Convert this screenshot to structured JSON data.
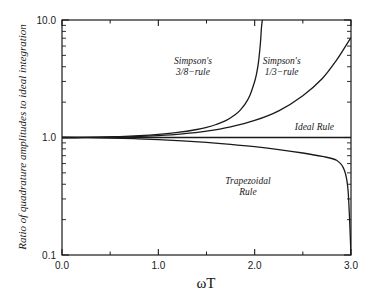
{
  "chart_data": {
    "type": "line",
    "title": "",
    "xlabel": "ωT",
    "ylabel": "Ratio of quadrature amplitudes to ideal integration",
    "xlim": [
      0.0,
      3.0
    ],
    "ylim": [
      0.1,
      10.0
    ],
    "yscale": "log",
    "xscale": "linear",
    "grid": false,
    "legend_position": "inline-annotations",
    "xticks": [
      "0.0",
      "1.0",
      "2.0",
      "3.0"
    ],
    "xtick_values": [
      0.0,
      1.0,
      2.0,
      3.0
    ],
    "yticks": [
      "0.1",
      "1.0",
      "10.0"
    ],
    "ytick_values": [
      0.1,
      1.0,
      10.0
    ],
    "series": [
      {
        "name": "Simpson's 3/8-rule",
        "label_lines": [
          "Simpson's",
          "3/8−rule"
        ],
        "x": [
          0.0,
          0.2,
          0.4,
          0.6,
          0.8,
          1.0,
          1.2,
          1.4,
          1.5,
          1.6,
          1.7,
          1.8,
          1.85,
          1.9,
          1.95,
          2.0,
          2.02,
          2.04,
          2.06,
          2.07,
          2.08
        ],
        "values": [
          1.0,
          1.001,
          1.007,
          1.018,
          1.036,
          1.063,
          1.104,
          1.17,
          1.22,
          1.29,
          1.39,
          1.57,
          1.71,
          1.92,
          2.28,
          3.0,
          3.5,
          4.4,
          6.4,
          8.5,
          10.0
        ]
      },
      {
        "name": "Simpson's 1/3-rule",
        "label_lines": [
          "Simpson's",
          "1/3−rule"
        ],
        "x": [
          0.0,
          0.25,
          0.5,
          0.75,
          1.0,
          1.25,
          1.5,
          1.75,
          2.0,
          2.25,
          2.5,
          2.7,
          2.85,
          2.95,
          3.0
        ],
        "values": [
          1.0,
          1.001,
          1.005,
          1.016,
          1.038,
          1.075,
          1.135,
          1.233,
          1.396,
          1.686,
          2.27,
          3.16,
          4.55,
          6.1,
          7.1
        ]
      },
      {
        "name": "Trapezoidal Rule",
        "label_lines": [
          "Trapezoidal",
          "Rule"
        ],
        "x": [
          0.0,
          0.25,
          0.5,
          0.75,
          1.0,
          1.25,
          1.5,
          1.75,
          2.0,
          2.25,
          2.5,
          2.7,
          2.85,
          2.93,
          2.97,
          3.0
        ],
        "values": [
          1.0,
          0.997,
          0.99,
          0.977,
          0.959,
          0.936,
          0.908,
          0.874,
          0.835,
          0.79,
          0.738,
          0.69,
          0.64,
          0.53,
          0.35,
          0.1
        ]
      },
      {
        "name": "Ideal Rule",
        "label_lines": [
          "Ideal Rule"
        ],
        "x": [
          0.0,
          3.0
        ],
        "values": [
          1.0,
          1.0
        ]
      }
    ],
    "annotations": [
      {
        "text_lines": [
          "Simpson's",
          "3/8−rule"
        ],
        "x": 1.36,
        "y": 4.2
      },
      {
        "text_lines": [
          "Simpson's",
          "1/3−rule"
        ],
        "x": 2.28,
        "y": 4.2
      },
      {
        "text_lines": [
          "Ideal Rule"
        ],
        "x": 2.62,
        "y": 1.16
      },
      {
        "text_lines": [
          "Trapezoidal",
          "Rule"
        ],
        "x": 1.93,
        "y": 0.4
      }
    ],
    "colors": {
      "curve": "#1a1a1a",
      "axis": "#1a1a1a",
      "background": "#ffffff",
      "text": "#1a1a1a"
    }
  }
}
